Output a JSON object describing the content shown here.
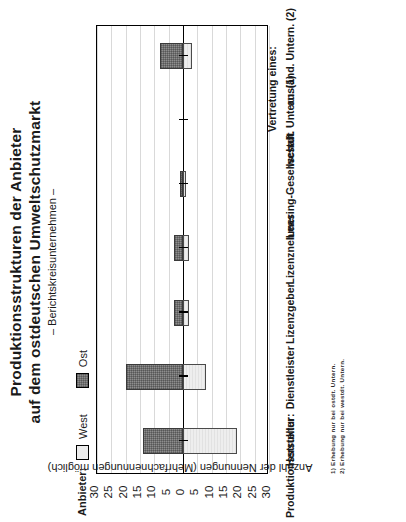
{
  "title": {
    "line1": "Produktionsstrukturen der Anbieter",
    "line2": "auf dem ostdeutschen Umweltschutzmarkt",
    "line3": "– Berichtskreisunternehmen –"
  },
  "legend": {
    "heading": "Anbieter:",
    "items": [
      {
        "label": "West",
        "color": "#ececec",
        "swatch": "west-swatch"
      },
      {
        "label": "Ost",
        "color": "#8c8c8c",
        "swatch": "ost-swatch"
      }
    ]
  },
  "axis": {
    "caption": "Anzahl der Nennungen  (Mehrfachnennungen möglich)",
    "category_heading": "Produktionsstruktur:",
    "ticks": [
      "30",
      "25",
      "20",
      "15",
      "10",
      "5",
      "0",
      "5",
      "10",
      "15",
      "20",
      "25",
      "30"
    ]
  },
  "footnotes": [
    "1) Erhebung nur bei ostdt. Untern.",
    "2) Erhebung nur bei westdt. Untern."
  ],
  "chart_data": {
    "type": "bar",
    "orientation": "vertical-diverging",
    "title": "Produktionsstrukturen der Anbieter auf dem ostdeutschen Umweltschutzmarkt – Berichtskreisunternehmen –",
    "xlabel": "Produktionsstruktur:",
    "ylabel": "Anzahl der Nennungen  (Mehrfachnennungen möglich)",
    "ylim": [
      -30,
      30
    ],
    "ytick_values": [
      -30,
      -25,
      -20,
      -15,
      -10,
      -5,
      0,
      5,
      10,
      15,
      20,
      25,
      30
    ],
    "ytick_labels": [
      "30",
      "25",
      "20",
      "15",
      "10",
      "5",
      "0",
      "5",
      "10",
      "15",
      "20",
      "25",
      "30"
    ],
    "grid": true,
    "legend_position": "top-left",
    "note": "Ost values plotted upward (positive); West values plotted downward (negative magnitude).",
    "categories": [
      "Hersteller",
      "Dienstleister",
      "Lizenzgeber",
      "Lizenznehmer",
      "Leasing-Gesellschaft",
      "westdt. Untern. (1)",
      "ausländ. Untern. (2)"
    ],
    "category_group_label": "Vertretung eines:",
    "series": [
      {
        "name": "Ost",
        "color": "#8c8c8c",
        "values": [
          14,
          20,
          3,
          3,
          1,
          0,
          8
        ]
      },
      {
        "name": "West",
        "color": "#ececec",
        "values": [
          19,
          8,
          2,
          2,
          1,
          0,
          3
        ]
      }
    ]
  }
}
